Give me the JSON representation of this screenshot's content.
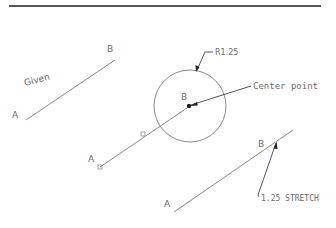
{
  "header_rule": {
    "x1": 9,
    "y": 6,
    "x2": 321,
    "color": "#555555"
  },
  "colors": {
    "line": "#8a8a8a",
    "text": "#6a6a6a",
    "leader": "#444444"
  },
  "given": {
    "label": "Given",
    "line": {
      "x1": 26,
      "y1": 120,
      "x2": 115,
      "y2": 60
    },
    "point_a": {
      "label": "A",
      "x": 12,
      "y": 118
    },
    "point_b": {
      "label": "B",
      "x": 107,
      "y": 52
    }
  },
  "step2": {
    "circle": {
      "cx": 190,
      "cy": 106,
      "r": 36
    },
    "line": {
      "x1": 100,
      "y1": 167,
      "x2": 190,
      "y2": 106
    },
    "grips": [
      {
        "x": 100,
        "y": 167
      },
      {
        "x": 143,
        "y": 134
      }
    ],
    "point_a": {
      "label": "A",
      "x": 88,
      "y": 162
    },
    "point_b": {
      "label": "B",
      "x": 181,
      "y": 100
    },
    "radius_callout": {
      "label": "R1.25",
      "text_x": 215,
      "text_y": 55
    },
    "center_callout": {
      "label": "Center point",
      "text_x": 253,
      "text_y": 89
    }
  },
  "step3": {
    "line": {
      "x1": 174,
      "y1": 212,
      "x2": 293,
      "y2": 130
    },
    "point_a": {
      "label": "A",
      "x": 164,
      "y": 207
    },
    "point_b": {
      "label": "B",
      "x": 258,
      "y": 147
    },
    "stretch_callout": {
      "label": "1.25 STRETCH",
      "text_x": 260,
      "text_y": 201
    }
  }
}
